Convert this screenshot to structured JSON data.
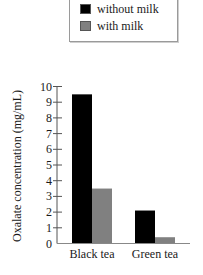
{
  "chart_data": {
    "type": "bar",
    "title": "",
    "xlabel": "",
    "ylabel": "Oxalate concentration (mg/mL)",
    "categories": [
      "Black tea",
      "Green tea"
    ],
    "series": [
      {
        "name": "without milk",
        "color": "#000000",
        "values": [
          9.5,
          2.1
        ]
      },
      {
        "name": "with milk",
        "color": "#808080",
        "values": [
          3.5,
          0.4
        ]
      }
    ],
    "ylim": [
      0,
      10
    ],
    "yticks": [
      0,
      1,
      2,
      3,
      4,
      5,
      6,
      7,
      8,
      9,
      10
    ],
    "grid": false,
    "legend_position": "top"
  },
  "legend": {
    "items": [
      {
        "label": "without milk",
        "color": "#000000"
      },
      {
        "label": "with milk",
        "color": "#808080"
      }
    ]
  },
  "axis": {
    "ylabel": "Oxalate concentration (mg/mL)"
  }
}
